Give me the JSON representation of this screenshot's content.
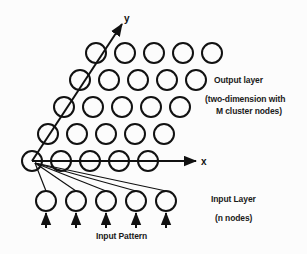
{
  "figure": {
    "background_color": "#fcfcfc",
    "stroke_color": "#111111"
  },
  "axes": {
    "x_label": "x",
    "y_label": "y",
    "x_axis": {
      "x1": 32,
      "y1": 161,
      "x2": 196,
      "y2": 161
    },
    "y_axis": {
      "x1": 32,
      "y1": 161,
      "x2": 122,
      "y2": 24
    },
    "x_label_pos": {
      "x": 201,
      "y": 165
    },
    "y_label_pos": {
      "x": 124,
      "y": 22
    }
  },
  "output_layer": {
    "label": "Output layer",
    "sub_line1": "(two-dimension with",
    "sub_line2": "M cluster nodes)",
    "rows": 5,
    "cols": 5,
    "radius": 10,
    "origin": {
      "x": 32,
      "y": 161
    },
    "col_spacing": 29,
    "row_spacing": 27,
    "row_shift": 16
  },
  "input_layer": {
    "label": "Input Layer",
    "sub_label": "(n nodes)",
    "count": 5,
    "radius": 10,
    "start_x": 46,
    "spacing": 30,
    "y": 201
  },
  "input_pattern": {
    "label": "Input Pattern",
    "arrow_count": 5,
    "arrow_start_y": 228,
    "arrow_end_y": 213
  }
}
